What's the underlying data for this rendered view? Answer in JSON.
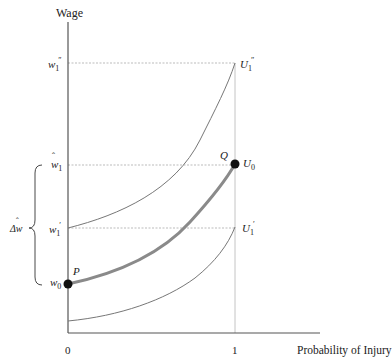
{
  "diagram": {
    "y_axis_label": "Wage",
    "x_axis_label": "Probability of Injury",
    "x_ticks": [
      "0",
      "1"
    ],
    "y_ticks": [
      {
        "base": "w",
        "sub": "1",
        "sup": "″",
        "hat": false,
        "name": "w1-double-prime"
      },
      {
        "base": "w",
        "sub": "1",
        "sup": "",
        "hat": true,
        "name": "w1-hat"
      },
      {
        "base": "w",
        "sub": "1",
        "sup": "′",
        "hat": false,
        "name": "w1-prime"
      },
      {
        "base": "w",
        "sub": "0",
        "sup": "",
        "hat": false,
        "name": "w0"
      }
    ],
    "curves": [
      {
        "label_base": "U",
        "label_sub": "1",
        "label_sup": "″",
        "name": "U1-double-prime"
      },
      {
        "label_base": "U",
        "label_sub": "0",
        "label_sup": "",
        "name": "U0"
      },
      {
        "label_base": "U",
        "label_sub": "1",
        "label_sup": "′",
        "name": "U1-prime"
      }
    ],
    "points": [
      {
        "label": "P",
        "name": "point-P"
      },
      {
        "label": "Q",
        "name": "point-Q"
      }
    ],
    "brace_label": "Δŵ",
    "brace_label_base": "Δw",
    "colors": {
      "axis": "#555555",
      "curve": "#777777",
      "thick_curve": "#8a8a8a",
      "dashed": "#aaaaaa",
      "point": "#111111",
      "text": "#222222"
    }
  }
}
